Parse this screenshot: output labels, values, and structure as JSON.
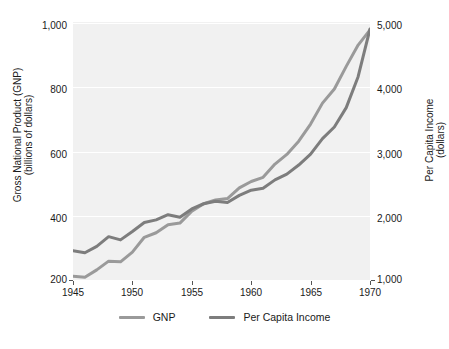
{
  "chart_data": {
    "type": "line",
    "title": "",
    "xlabel": "",
    "ylabel": "Gross National Product (GNP) (billions of dollars)",
    "y2label": "Per Capita Income (dollars)",
    "grid": true,
    "legend_position": "bottom",
    "xlim": [
      1945,
      1970
    ],
    "ylim": [
      200,
      1000
    ],
    "y2lim": [
      1000,
      5000
    ],
    "xticks": [
      "1945",
      "1950",
      "1955",
      "1960",
      "1965",
      "1970"
    ],
    "xtick_values": [
      1945,
      1950,
      1955,
      1960,
      1965,
      1970
    ],
    "yticks": [
      "200",
      "400",
      "600",
      "800",
      "1,000"
    ],
    "ytick_values": [
      200,
      400,
      600,
      800,
      1000
    ],
    "y2ticks": [
      "1,000",
      "2,000",
      "3,000",
      "4,000",
      "5,000"
    ],
    "y2tick_values": [
      1000,
      2000,
      3000,
      4000,
      5000
    ],
    "x": [
      1945,
      1946,
      1947,
      1948,
      1949,
      1950,
      1951,
      1952,
      1953,
      1954,
      1955,
      1956,
      1957,
      1958,
      1959,
      1960,
      1961,
      1962,
      1963,
      1964,
      1965,
      1966,
      1967,
      1968,
      1969,
      1970
    ],
    "series": [
      {
        "name": "GNP",
        "axis": "left",
        "color": "#9a9a9a",
        "unit": "billions of dollars",
        "values": [
          213,
          210,
          233,
          260,
          258,
          288,
          334,
          348,
          373,
          378,
          415,
          438,
          450,
          454,
          487,
          507,
          520,
          561,
          591,
          632,
          685,
          750,
          794,
          864,
          930,
          977
        ]
      },
      {
        "name": "Per Capita Income",
        "axis": "right",
        "color": "#7d7d7d",
        "unit": "dollars",
        "values": [
          1460,
          1430,
          1530,
          1680,
          1630,
          1760,
          1900,
          1940,
          2020,
          1980,
          2110,
          2190,
          2230,
          2210,
          2320,
          2400,
          2430,
          2560,
          2650,
          2790,
          2960,
          3200,
          3380,
          3680,
          4160,
          4900
        ]
      }
    ]
  },
  "axes": {
    "left_title_line1": "Gross National Product (GNP)",
    "left_title_line2": "(billions of dollars)",
    "right_title_line1": "Per Capita Income",
    "right_title_line2": "(dollars)"
  },
  "legend": {
    "items": [
      {
        "label": "GNP",
        "color": "#9a9a9a"
      },
      {
        "label": "Per Capita Income",
        "color": "#7d7d7d"
      }
    ]
  },
  "colors": {
    "plot_background": "#f1f1f1",
    "page_background": "#ffffff",
    "gridline": "#ffffff",
    "text": "#1a1a1a",
    "gnp_line": "#9a9a9a",
    "per_capita_line": "#7d7d7d"
  }
}
